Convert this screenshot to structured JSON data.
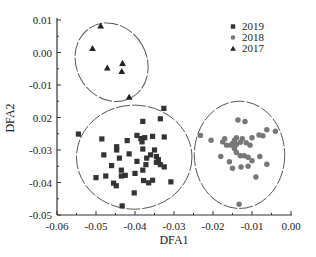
{
  "chart_data": {
    "type": "scatter",
    "title": "",
    "xlabel": "DFA1",
    "ylabel": "DFA2",
    "xlim": [
      -0.06,
      0.0
    ],
    "ylim": [
      -0.05,
      0.01
    ],
    "x_ticks": [
      "-0.06",
      "-0.05",
      "-0.04",
      "-0.03",
      "-0.02",
      "-0.01",
      "0.00"
    ],
    "y_ticks": [
      "0.01",
      "0.00",
      "-0.01",
      "0.02",
      "-0.03",
      "-0.04",
      "-0.05"
    ],
    "grid": false,
    "legend_position": "upper right",
    "legend": [
      {
        "label": "2019",
        "marker": "square"
      },
      {
        "label": "2018",
        "marker": "circle"
      },
      {
        "label": "2017",
        "marker": "triangle"
      }
    ],
    "series": [
      {
        "name": "2019",
        "marker": "square",
        "color": "#333333",
        "points": [
          [
            -0.0326,
            -0.0172
          ],
          [
            -0.0335,
            -0.0204
          ],
          [
            -0.038,
            -0.0212
          ],
          [
            -0.0545,
            -0.0251
          ],
          [
            -0.0485,
            -0.0266
          ],
          [
            -0.0447,
            -0.029
          ],
          [
            -0.0447,
            -0.03
          ],
          [
            -0.042,
            -0.0271
          ],
          [
            -0.0395,
            -0.0255
          ],
          [
            -0.0385,
            -0.0265
          ],
          [
            -0.0375,
            -0.0262
          ],
          [
            -0.0355,
            -0.0258
          ],
          [
            -0.0325,
            -0.026
          ],
          [
            -0.0382,
            -0.0275
          ],
          [
            -0.048,
            -0.0315
          ],
          [
            -0.044,
            -0.0325
          ],
          [
            -0.0415,
            -0.0312
          ],
          [
            -0.038,
            -0.0297
          ],
          [
            -0.037,
            -0.0325
          ],
          [
            -0.036,
            -0.0315
          ],
          [
            -0.035,
            -0.03
          ],
          [
            -0.0345,
            -0.032
          ],
          [
            -0.034,
            -0.033
          ],
          [
            -0.0335,
            -0.0345
          ],
          [
            -0.0325,
            -0.0352
          ],
          [
            -0.046,
            -0.0348
          ],
          [
            -0.0435,
            -0.0362
          ],
          [
            -0.04,
            -0.0372
          ],
          [
            -0.038,
            -0.0362
          ],
          [
            -0.0475,
            -0.038
          ],
          [
            -0.05,
            -0.0385
          ],
          [
            -0.0455,
            -0.0402
          ],
          [
            -0.0448,
            -0.041
          ],
          [
            -0.0435,
            -0.038
          ],
          [
            -0.0425,
            -0.0378
          ],
          [
            -0.0378,
            -0.0394
          ],
          [
            -0.0365,
            -0.0401
          ],
          [
            -0.0355,
            -0.0393
          ],
          [
            -0.0308,
            -0.0398
          ],
          [
            -0.0402,
            -0.0432
          ],
          [
            -0.0433,
            -0.0472
          ],
          [
            -0.0372,
            -0.0345
          ],
          [
            -0.0395,
            -0.0335
          ],
          [
            -0.0345,
            -0.0338
          ]
        ]
      },
      {
        "name": "2018",
        "marker": "circle",
        "color": "#777777",
        "points": [
          [
            -0.0136,
            -0.0208
          ],
          [
            -0.0118,
            -0.0212
          ],
          [
            -0.0062,
            -0.0238
          ],
          [
            -0.004,
            -0.0242
          ],
          [
            -0.0232,
            -0.0255
          ],
          [
            -0.0205,
            -0.027
          ],
          [
            -0.017,
            -0.0265
          ],
          [
            -0.014,
            -0.0262
          ],
          [
            -0.0125,
            -0.0265
          ],
          [
            -0.01,
            -0.0262
          ],
          [
            -0.0082,
            -0.0254
          ],
          [
            -0.0072,
            -0.0256
          ],
          [
            -0.0175,
            -0.0275
          ],
          [
            -0.0165,
            -0.0285
          ],
          [
            -0.0155,
            -0.0285
          ],
          [
            -0.015,
            -0.028
          ],
          [
            -0.0145,
            -0.027
          ],
          [
            -0.014,
            -0.0283
          ],
          [
            -0.013,
            -0.0276
          ],
          [
            -0.0115,
            -0.0278
          ],
          [
            -0.0105,
            -0.0285
          ],
          [
            -0.0145,
            -0.0295
          ],
          [
            -0.014,
            -0.0308
          ],
          [
            -0.013,
            -0.0318
          ],
          [
            -0.012,
            -0.0318
          ],
          [
            -0.011,
            -0.0322
          ],
          [
            -0.018,
            -0.032
          ],
          [
            -0.0158,
            -0.0336
          ],
          [
            -0.01,
            -0.0333
          ],
          [
            -0.008,
            -0.032
          ],
          [
            -0.015,
            -0.0356
          ],
          [
            -0.0128,
            -0.0352
          ],
          [
            -0.011,
            -0.035
          ],
          [
            -0.0062,
            -0.0344
          ],
          [
            -0.009,
            -0.0383
          ],
          [
            -0.0133,
            -0.0467
          ]
        ]
      },
      {
        "name": "2017",
        "marker": "triangle",
        "color": "#222222",
        "points": [
          [
            -0.0488,
            0.0082
          ],
          [
            -0.0509,
            0.0013
          ],
          [
            -0.0471,
            -0.0047
          ],
          [
            -0.0432,
            -0.0033
          ],
          [
            -0.0434,
            -0.0058
          ],
          [
            -0.0415,
            -0.0137
          ]
        ]
      }
    ],
    "ellipses": [
      {
        "group": "2017",
        "cx": -0.046,
        "cy": -0.003,
        "rx": 0.009,
        "ry": 0.0125,
        "rotation_deg": -30
      },
      {
        "group": "2019",
        "cx": -0.0402,
        "cy": -0.0322,
        "rx": 0.0148,
        "ry": 0.016,
        "rotation_deg": 0
      },
      {
        "group": "2018",
        "cx": -0.0132,
        "cy": -0.0315,
        "rx": 0.0116,
        "ry": 0.0165,
        "rotation_deg": 0
      }
    ]
  }
}
